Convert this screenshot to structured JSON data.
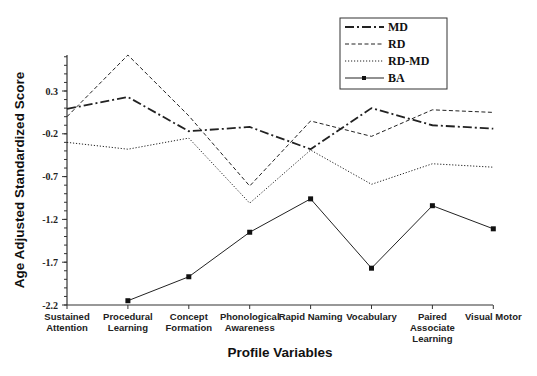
{
  "chart_data": {
    "type": "line",
    "title": "",
    "xlabel": "Profile Variables",
    "ylabel": "Age Adjusted Standardized Score",
    "categories": [
      "Sustained Attention",
      "Procedural Learning",
      "Concept Formation",
      "Phonological Awareness",
      "Rapid Naming",
      "Vocabulary",
      "Paired Associate Learning",
      "Visual Motor"
    ],
    "category_lines": [
      [
        "Sustained",
        "Attention"
      ],
      [
        "Procedural",
        "Learning"
      ],
      [
        "Concept",
        "Formation"
      ],
      [
        "Phonological",
        "Awareness"
      ],
      [
        "Rapid Naming"
      ],
      [
        "Vocabulary"
      ],
      [
        "Paired",
        "Associate",
        "Learning"
      ],
      [
        "Visual Motor"
      ]
    ],
    "yticks": [
      0.3,
      -0.2,
      -0.7,
      -1.2,
      -1.7,
      -2.2
    ],
    "ytick_labels": [
      "0.3",
      "-0.2",
      "-0.7",
      "-1.2",
      "-1.7",
      "-2.2"
    ],
    "ylim": [
      -2.2,
      0.72
    ],
    "grid": false,
    "legend_position": "upper right",
    "series": [
      {
        "name": "MD",
        "style": "dash-dot",
        "values": [
          0.09,
          0.23,
          -0.17,
          -0.12,
          -0.38,
          0.1,
          -0.1,
          -0.14
        ]
      },
      {
        "name": "RD",
        "style": "dashed",
        "values": [
          0.0,
          0.72,
          0.01,
          -0.81,
          -0.05,
          -0.23,
          0.08,
          0.05
        ]
      },
      {
        "name": "RD-MD",
        "style": "dotted",
        "values": [
          -0.3,
          -0.38,
          -0.25,
          -1.01,
          -0.39,
          -0.79,
          -0.55,
          -0.59
        ]
      },
      {
        "name": "BA",
        "style": "solid-square-markers",
        "values": [
          null,
          -2.15,
          -1.87,
          -1.35,
          -0.96,
          -1.77,
          -1.04,
          -1.31
        ]
      }
    ]
  }
}
